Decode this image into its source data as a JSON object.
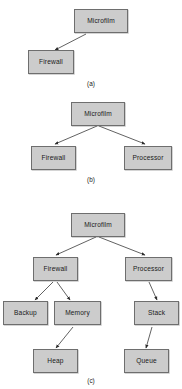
{
  "figure": {
    "background_color": "#ffffff",
    "node_fill_color": "#cccccc",
    "node_border_color": "#6e6e6e",
    "edge_color": "#3a3a3a",
    "text_color": "#1a1a1a",
    "panels": [
      {
        "id": "a",
        "caption": "(a)",
        "nodes": [
          {
            "key": "a_microfilm",
            "label": "Microfilm"
          },
          {
            "key": "a_firewall",
            "label": "Firewall"
          }
        ],
        "edges": [
          {
            "from": "Microfilm",
            "to": "Firewall"
          }
        ]
      },
      {
        "id": "b",
        "caption": "(b)",
        "nodes": [
          {
            "key": "b_microfilm",
            "label": "Microfilm"
          },
          {
            "key": "b_firewall",
            "label": "Firewall"
          },
          {
            "key": "b_processor",
            "label": "Processor"
          }
        ],
        "edges": [
          {
            "from": "Microfilm",
            "to": "Firewall"
          },
          {
            "from": "Microfilm",
            "to": "Processor"
          }
        ]
      },
      {
        "id": "c",
        "caption": "(c)",
        "nodes": [
          {
            "key": "c_microfilm",
            "label": "Microfilm"
          },
          {
            "key": "c_firewall",
            "label": "Firewall"
          },
          {
            "key": "c_processor",
            "label": "Processor"
          },
          {
            "key": "c_backup",
            "label": "Backup"
          },
          {
            "key": "c_memory",
            "label": "Memory"
          },
          {
            "key": "c_stack",
            "label": "Stack"
          },
          {
            "key": "c_heap",
            "label": "Heap"
          },
          {
            "key": "c_queue",
            "label": "Queue"
          }
        ],
        "edges": [
          {
            "from": "Microfilm",
            "to": "Firewall"
          },
          {
            "from": "Microfilm",
            "to": "Processor"
          },
          {
            "from": "Firewall",
            "to": "Backup"
          },
          {
            "from": "Firewall",
            "to": "Memory"
          },
          {
            "from": "Processor",
            "to": "Stack"
          },
          {
            "from": "Memory",
            "to": "Heap"
          },
          {
            "from": "Stack",
            "to": "Queue"
          }
        ]
      }
    ]
  }
}
